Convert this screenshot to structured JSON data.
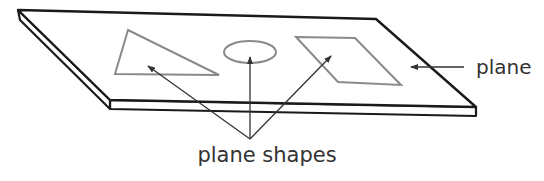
{
  "diagram": {
    "labels": {
      "plane": "plane",
      "plane_shapes": "plane shapes"
    },
    "shapes": [
      "triangle",
      "ellipse",
      "parallelogram"
    ],
    "colors": {
      "plane_outline": "#1a1a1a",
      "shape_outline": "#8a8a8a",
      "arrow": "#333333",
      "text": "#333333"
    }
  }
}
